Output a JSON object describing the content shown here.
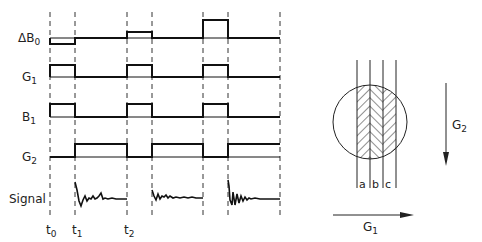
{
  "timing_diagram": {
    "rows": [
      {
        "label": "ΔB",
        "sub": "0"
      },
      {
        "label": "G",
        "sub": "1"
      },
      {
        "label": "B",
        "sub": "1"
      },
      {
        "label": "G",
        "sub": "2"
      },
      {
        "label": "Signal",
        "sub": ""
      }
    ],
    "time_markers": [
      {
        "label": "t",
        "sub": "0"
      },
      {
        "label": "t",
        "sub": "1"
      },
      {
        "label": "t",
        "sub": "2"
      }
    ]
  },
  "slice_diagram": {
    "strip_labels": [
      "a",
      "b",
      "c"
    ],
    "g2_label": "G",
    "g2_sub": "2",
    "g1_label": "G",
    "g1_sub": "1"
  }
}
